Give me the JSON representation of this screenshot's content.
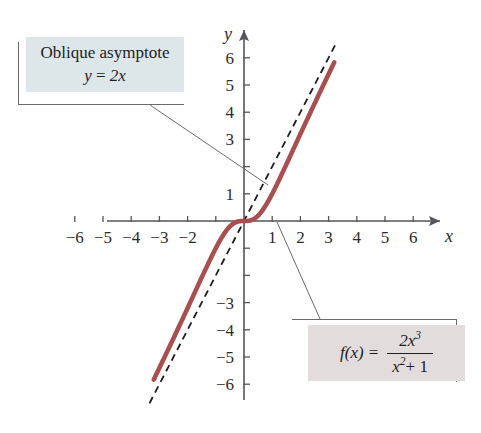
{
  "chart_data": {
    "type": "line",
    "title": "",
    "xlabel": "x",
    "ylabel": "y",
    "xlim": [
      -6.8,
      6.8
    ],
    "ylim": [
      -6.8,
      6.8
    ],
    "grid": false,
    "legend": "none",
    "x_ticks": [
      -6,
      -5,
      -4,
      -3,
      -2,
      -1,
      1,
      2,
      3,
      4,
      5,
      6
    ],
    "x_tick_labels": [
      "-6",
      "-5",
      "-4",
      "-3",
      "-2",
      "",
      "1",
      "2",
      "3",
      "4",
      "5",
      "6"
    ],
    "y_ticks": [
      -6,
      -5,
      -4,
      -3,
      -2,
      -1,
      1,
      2,
      3,
      4,
      5,
      6
    ],
    "y_tick_labels": [
      "-6",
      "-5",
      "-4",
      "-3",
      "",
      "",
      "1",
      "",
      "3",
      "4",
      "5",
      "6"
    ],
    "series": [
      {
        "name": "f(x) = 2x^3/(x^2 + 1)",
        "style": "solid",
        "color": "#a8504f",
        "width": 4.6,
        "x_range": [
          -3.2,
          3.2
        ],
        "points": [
          [
            -3.2,
            -6.02
          ],
          [
            -3.0,
            -5.4
          ],
          [
            -2.8,
            -4.79
          ],
          [
            -2.6,
            -4.18
          ],
          [
            -2.4,
            -3.58
          ],
          [
            -2.2,
            -2.99
          ],
          [
            -2.0,
            -2.4
          ],
          [
            -1.8,
            -1.83
          ],
          [
            -1.6,
            -1.28
          ],
          [
            -1.4,
            -0.77
          ],
          [
            -1.2,
            -0.4
          ],
          [
            -1.0,
            -1.0
          ],
          [
            -0.8,
            -0.62
          ],
          [
            -0.6,
            -0.32
          ],
          [
            -0.4,
            -0.11
          ],
          [
            -0.2,
            -0.02
          ],
          [
            0.0,
            0.0
          ],
          [
            0.2,
            0.02
          ],
          [
            0.4,
            0.11
          ],
          [
            0.6,
            0.32
          ],
          [
            0.8,
            0.62
          ],
          [
            1.0,
            1.0
          ],
          [
            1.2,
            1.42
          ],
          [
            1.4,
            1.86
          ],
          [
            1.6,
            2.3
          ],
          [
            1.8,
            2.75
          ],
          [
            2.0,
            3.2
          ],
          [
            2.2,
            3.66
          ],
          [
            2.4,
            4.12
          ],
          [
            2.6,
            4.58
          ],
          [
            2.8,
            5.04
          ],
          [
            3.0,
            5.4
          ],
          [
            3.2,
            6.02
          ]
        ]
      },
      {
        "name": "y = 2x",
        "style": "dashed",
        "color": "#1d1d1f",
        "width": 1.8,
        "x_range": [
          -3.35,
          3.25
        ],
        "points": [
          [
            -3.35,
            -6.7
          ],
          [
            3.25,
            6.5
          ]
        ]
      }
    ]
  },
  "callouts": {
    "asymptote": {
      "line1": "Oblique asymptote",
      "equation_lhs": "y",
      "equation_eq": "=",
      "equation_rhs": "2x"
    },
    "function": {
      "lhs": "f(x)",
      "eq": "=",
      "numerator": "2x",
      "numerator_exp": "3",
      "denominator_base": "x",
      "denominator_exp": "2",
      "denominator_tail": "+ 1"
    }
  },
  "axes": {
    "x_name": "x",
    "y_name": "y"
  },
  "colors": {
    "curve": "#a8504f",
    "asymptote": "#1d1d1f",
    "axis": "#55555a",
    "callout_asymptote_bg": "#dde6e9",
    "callout_function_bg": "#e2dcdc",
    "leader_line": "#6a6a6a"
  }
}
